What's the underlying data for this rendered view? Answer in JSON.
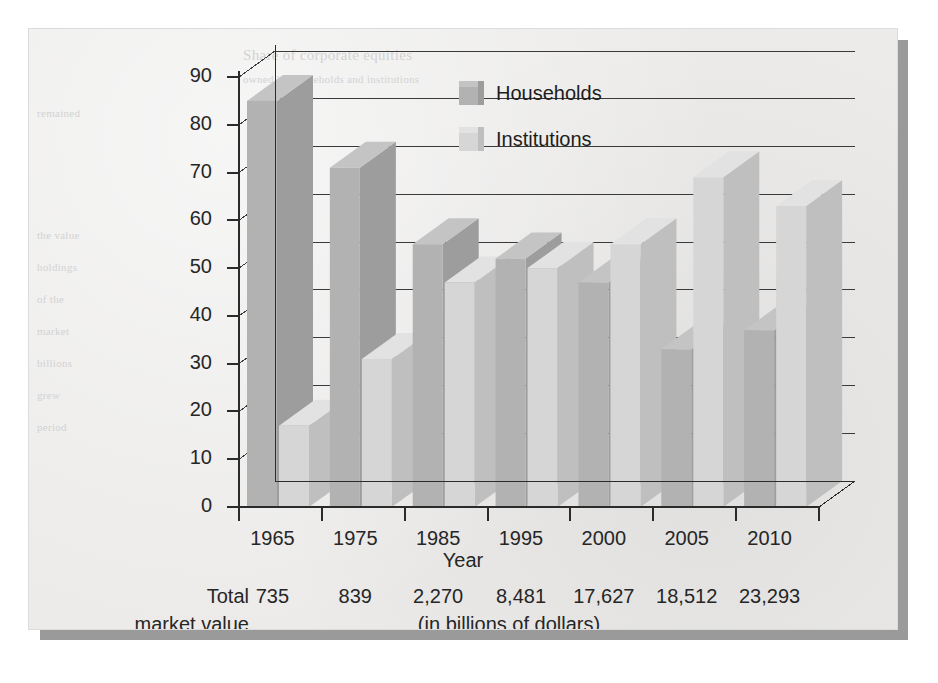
{
  "chart_data": {
    "type": "bar",
    "title": "",
    "xlabel": "Year",
    "ylabel": "",
    "ylim": [
      0,
      90
    ],
    "yticks": [
      0,
      10,
      20,
      30,
      40,
      50,
      60,
      70,
      80,
      90
    ],
    "grid": true,
    "legend_position": "top-center",
    "categories": [
      "1965",
      "1975",
      "1985",
      "1995",
      "2000",
      "2005",
      "2010"
    ],
    "series": [
      {
        "name": "Households",
        "values": [
          85,
          71,
          55,
          52,
          47,
          33,
          37
        ],
        "color": "#b2b2b2"
      },
      {
        "name": "Institutions",
        "values": [
          17,
          31,
          47,
          50,
          55,
          69,
          63
        ],
        "color": "#d6d6d6"
      }
    ],
    "footer_label_line1": "Total",
    "footer_label_line2": "market value",
    "footer_values": [
      "735",
      "839",
      "2,270",
      "8,481",
      "17,627",
      "18,512",
      "23,293"
    ],
    "footer_unit": "(in billions of dollars)"
  },
  "legend": {
    "items": [
      {
        "label": "Households"
      },
      {
        "label": "Institutions"
      }
    ]
  },
  "axes": {
    "x_title": "Year",
    "y_ticks": [
      "90",
      "80",
      "70",
      "60",
      "50",
      "40",
      "30",
      "20",
      "10",
      "0"
    ],
    "x_ticks": [
      "1965",
      "1975",
      "1985",
      "1995",
      "2000",
      "2005",
      "2010"
    ]
  },
  "footer": {
    "caption_line1": "Total",
    "caption_line2": "market value",
    "unit": "(in billions of dollars)",
    "values": [
      "735",
      "839",
      "2,270",
      "8,481",
      "17,627",
      "18,512",
      "23,293"
    ]
  },
  "bleed_text": {
    "l1": "Share of corporate equities",
    "l2": "owned by households and institutions",
    "l3": "remained",
    "l4": "the value",
    "l5": "holdings",
    "l6": "of the",
    "l7": "market",
    "l8": "billions",
    "l9": "grew",
    "l10": "period"
  },
  "colors": {
    "panel": "#ecebea",
    "shadow": "#9a9a9a",
    "households": "#b2b2b2",
    "households_side": "#9d9d9d",
    "households_top": "#c4c4c4",
    "institutions": "#d6d6d6",
    "institutions_side": "#bfbfbf",
    "institutions_top": "#e2e2e2",
    "axis": "#2b2b2b",
    "text": "#262626"
  }
}
